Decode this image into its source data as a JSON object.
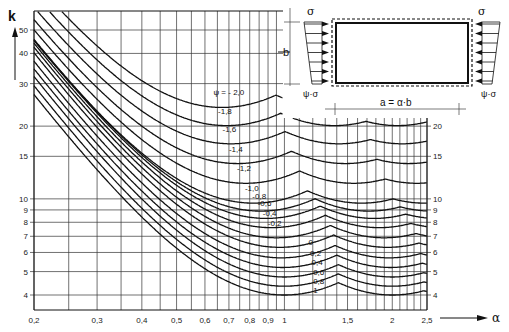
{
  "chart_data": {
    "type": "line",
    "xlabel": "α",
    "ylabel": "k",
    "xscale": "log",
    "yscale": "log",
    "xlim": [
      0.2,
      2.5
    ],
    "ylim": [
      3.6,
      58
    ],
    "grid": true,
    "x_tick_labels": [
      "0,2",
      "0,3",
      "0,4",
      "0,5",
      "0,6",
      "0,7",
      "0,8",
      "0,9",
      "1",
      "1,5",
      "2",
      "2,5"
    ],
    "x_ticks": [
      0.2,
      0.3,
      0.4,
      0.5,
      0.6,
      0.7,
      0.8,
      0.9,
      1,
      1.5,
      2,
      2.5
    ],
    "x_minor_grid": [
      0.25,
      0.35,
      0.45,
      0.55,
      0.65,
      0.75,
      0.85,
      0.95,
      1.1,
      1.2,
      1.3,
      1.4,
      1.6,
      1.7,
      1.8,
      1.9,
      2.1,
      2.2,
      2.3,
      2.4
    ],
    "y_tick_labels_left": [
      "50",
      "40",
      "30",
      "20",
      "15",
      "10",
      "9",
      "8",
      "7",
      "6",
      "5",
      "4"
    ],
    "y_tick_labels_right": [
      "20",
      "15",
      "10",
      "9",
      "8",
      "7",
      "6",
      "5",
      "4"
    ],
    "y_ticks": [
      50,
      40,
      30,
      20,
      15,
      10,
      9,
      8,
      7,
      6,
      5,
      4
    ],
    "series": [
      {
        "name": "ψ = -2,0",
        "label": "ψ = - 2,0",
        "kmin": 23.9,
        "alpha_min": 0.67
      },
      {
        "name": "ψ = -1,8",
        "label": "-1,8",
        "kmin": 20.1,
        "alpha_min": 0.69
      },
      {
        "name": "ψ = -1,6",
        "label": "-1,6",
        "kmin": 16.9,
        "alpha_min": 0.71
      },
      {
        "name": "ψ = -1,4",
        "label": "-1,4",
        "kmin": 14.0,
        "alpha_min": 0.74
      },
      {
        "name": "ψ = -1,2",
        "label": "-1,2",
        "kmin": 11.6,
        "alpha_min": 0.78
      },
      {
        "name": "ψ = -1,0",
        "label": "-1,0",
        "kmin": 9.6,
        "alpha_min": 0.82
      },
      {
        "name": "ψ = -0,8",
        "label": "-0,8",
        "kmin": 8.9,
        "alpha_min": 0.86
      },
      {
        "name": "ψ = -0,6",
        "label": "-0,6",
        "kmin": 8.3,
        "alpha_min": 0.89
      },
      {
        "name": "ψ = -0,4",
        "label": "-0,4",
        "kmin": 7.6,
        "alpha_min": 0.92
      },
      {
        "name": "ψ = -0,2",
        "label": "-0,2",
        "kmin": 6.9,
        "alpha_min": 0.95
      },
      {
        "name": "ψ = 0",
        "label": "0",
        "kmin": 6.3,
        "alpha_min": 0.97
      },
      {
        "name": "ψ = 0,2",
        "label": "0,2",
        "kmin": 5.7,
        "alpha_min": 0.98
      },
      {
        "name": "ψ = 0,4",
        "label": "0,4",
        "kmin": 5.2,
        "alpha_min": 0.99
      },
      {
        "name": "ψ = 0,6",
        "label": "0,6",
        "kmin": 4.75,
        "alpha_min": 1.0
      },
      {
        "name": "ψ = 0,8",
        "label": "0,8",
        "kmin": 4.35,
        "alpha_min": 1.0
      },
      {
        "name": "ψ = 1",
        "label": "1",
        "kmin": 4.0,
        "alpha_min": 1.0
      }
    ],
    "annotations": {
      "diagram_top_stress": "σ",
      "diagram_bottom_stress": "ψ·σ",
      "diagram_width": "a = α·b",
      "diagram_height": "b"
    }
  },
  "labels": {
    "y_axis": "k",
    "x_axis": "α",
    "sigma_left": "σ",
    "sigma_right": "σ",
    "psi_sigma_left": "ψ·σ",
    "psi_sigma_right": "ψ·σ",
    "width_label": "a = α·b",
    "height_label": "b"
  }
}
